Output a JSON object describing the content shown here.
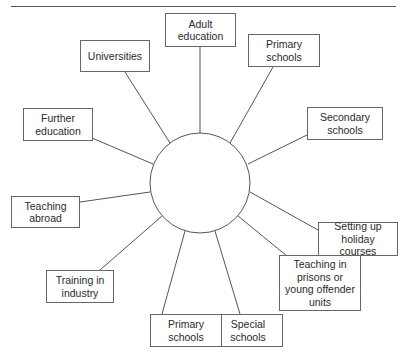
{
  "diagram": {
    "type": "spider",
    "center": {
      "label": "",
      "cx": 200,
      "cy": 183,
      "r": 50
    },
    "nodes": [
      {
        "id": "adult-education",
        "label": "Adult\neducation",
        "x": 165,
        "y": 13,
        "w": 71,
        "h": 34,
        "ax": 200,
        "ay": 47,
        "cx": 200,
        "cy": 133
      },
      {
        "id": "primary-schools-top",
        "label": "Primary\nschools",
        "x": 248,
        "y": 34,
        "w": 72,
        "h": 33,
        "ax": 273,
        "ay": 67,
        "cx": 230,
        "cy": 143
      },
      {
        "id": "secondary-schools",
        "label": "Secondary\nschools",
        "x": 307,
        "y": 107,
        "w": 76,
        "h": 33,
        "ax": 307,
        "ay": 135,
        "cx": 248,
        "cy": 164
      },
      {
        "id": "setting-up-holiday-courses",
        "label": "Setting up\nholiday courses",
        "x": 318,
        "y": 222,
        "w": 80,
        "h": 34,
        "ax": 318,
        "ay": 230,
        "cx": 250,
        "cy": 192
      },
      {
        "id": "teaching-in-prisons",
        "label": "Teaching in\nprisons or\nyoung offender\nunits",
        "x": 279,
        "y": 255,
        "w": 82,
        "h": 56,
        "ax": 287,
        "ay": 256,
        "cx": 238,
        "cy": 216
      },
      {
        "id": "special-schools",
        "label": "Special\nschools",
        "x": 213,
        "y": 314,
        "w": 70,
        "h": 33,
        "ax": 240,
        "ay": 314,
        "cx": 215,
        "cy": 231
      },
      {
        "id": "primary-schools-bottom",
        "label": "Primary\nschools",
        "x": 150,
        "y": 314,
        "w": 72,
        "h": 33,
        "ax": 162,
        "ay": 314,
        "cx": 185,
        "cy": 231
      },
      {
        "id": "training-in-industry",
        "label": "Training in\nindustry",
        "x": 46,
        "y": 270,
        "w": 68,
        "h": 33,
        "ax": 100,
        "ay": 270,
        "cx": 162,
        "cy": 216
      },
      {
        "id": "teaching-abroad",
        "label": "Teaching\nabroad",
        "x": 11,
        "y": 196,
        "w": 69,
        "h": 32,
        "ax": 80,
        "ay": 202,
        "cx": 150,
        "cy": 192
      },
      {
        "id": "further-education",
        "label": "Further\neducation",
        "x": 23,
        "y": 108,
        "w": 70,
        "h": 33,
        "ax": 92,
        "ay": 138,
        "cx": 153,
        "cy": 164
      },
      {
        "id": "universities",
        "label": "Universities",
        "x": 80,
        "y": 40,
        "w": 70,
        "h": 32,
        "ax": 125,
        "ay": 72,
        "cx": 170,
        "cy": 143
      }
    ]
  }
}
